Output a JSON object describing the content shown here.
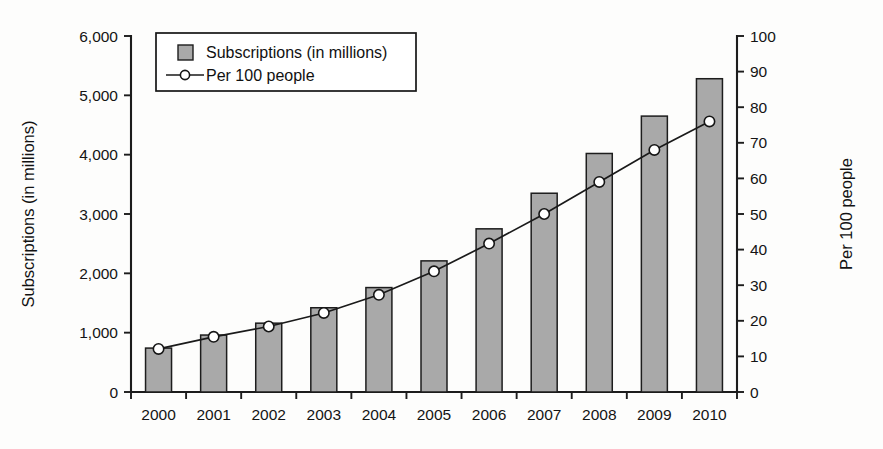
{
  "chart_data": {
    "type": "bar",
    "title": "",
    "subtitle": "",
    "xlabel": "",
    "ylabel": "Subscriptions (in millions)",
    "y2label": "Per 100 people",
    "grid": false,
    "legend_position": "top-left",
    "categories": [
      "2000",
      "2001",
      "2002",
      "2003",
      "2004",
      "2005",
      "2006",
      "2007",
      "2008",
      "2009",
      "2010"
    ],
    "ylim": [
      0,
      6000
    ],
    "yticks": [
      "0",
      "1,000",
      "2,000",
      "3,000",
      "4,000",
      "5,000",
      "6,000"
    ],
    "ytick_values": [
      0,
      1000,
      2000,
      3000,
      4000,
      5000,
      6000
    ],
    "y2lim": [
      0,
      100
    ],
    "y2ticks": [
      "0",
      "10",
      "20",
      "30",
      "40",
      "50",
      "60",
      "70",
      "80",
      "90",
      "100"
    ],
    "y2tick_values": [
      0,
      10,
      20,
      30,
      40,
      50,
      60,
      70,
      80,
      90,
      100
    ],
    "series": [
      {
        "name": "Subscriptions (in millions)",
        "kind": "bar",
        "axis": "left",
        "color": "#a9a9a9",
        "values": [
          740,
          960,
          1160,
          1420,
          1760,
          2210,
          2750,
          3350,
          4020,
          4650,
          5280
        ]
      },
      {
        "name": "Per 100 people",
        "kind": "line",
        "axis": "right",
        "color": "#1a1a1a",
        "marker": "open-circle",
        "values": [
          12.1,
          15.5,
          18.4,
          22.2,
          27.3,
          33.9,
          41.7,
          50.0,
          59.0,
          68.0,
          76.0
        ]
      }
    ]
  },
  "legend": {
    "items": [
      {
        "label": "Subscriptions (in millions)",
        "marker": "square-swatch"
      },
      {
        "label": "Per 100 people",
        "marker": "line-with-circle"
      }
    ]
  },
  "axes": {
    "left_title": "Subscriptions (in millions)",
    "right_title": "Per 100 people"
  }
}
